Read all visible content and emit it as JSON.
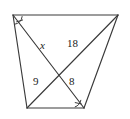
{
  "figure": {
    "type": "geometry-diagram",
    "shape": "trapezoid-with-intersecting-cevians",
    "stroke_color": "#3a3a3a",
    "background_color": "#ffffff",
    "label_color": "#1a1a1a",
    "vertices": {
      "top_left": {
        "x": 13,
        "y": 15
      },
      "top_right": {
        "x": 118,
        "y": 15
      },
      "bottom_right": {
        "x": 84,
        "y": 108
      },
      "bottom_left": {
        "x": 27,
        "y": 108
      },
      "intersection": {
        "x": 63,
        "y": 70
      }
    },
    "segments": [
      {
        "name": "top-side",
        "from": "top_left",
        "to": "top_right"
      },
      {
        "name": "left-side",
        "from": "top_left",
        "to": "bottom_left"
      },
      {
        "name": "bottom-side",
        "from": "bottom_left",
        "to": "bottom_right"
      },
      {
        "name": "right-side",
        "from": "top_right",
        "to": "bottom_right"
      },
      {
        "name": "diagonal-top-left-to-bottom-right",
        "from": "top_left",
        "to": "bottom_right"
      },
      {
        "name": "diagonal-top-right-to-bottom-left",
        "from": "top_right",
        "to": "bottom_left"
      }
    ],
    "labels": {
      "x": "x",
      "eighteen": "18",
      "nine": "9",
      "eight": "8"
    },
    "angle_marks": [
      {
        "name": "top-left-angle-mark",
        "at": "top_left"
      },
      {
        "name": "bottom-right-angle-mark",
        "at": "bottom_right"
      }
    ]
  }
}
